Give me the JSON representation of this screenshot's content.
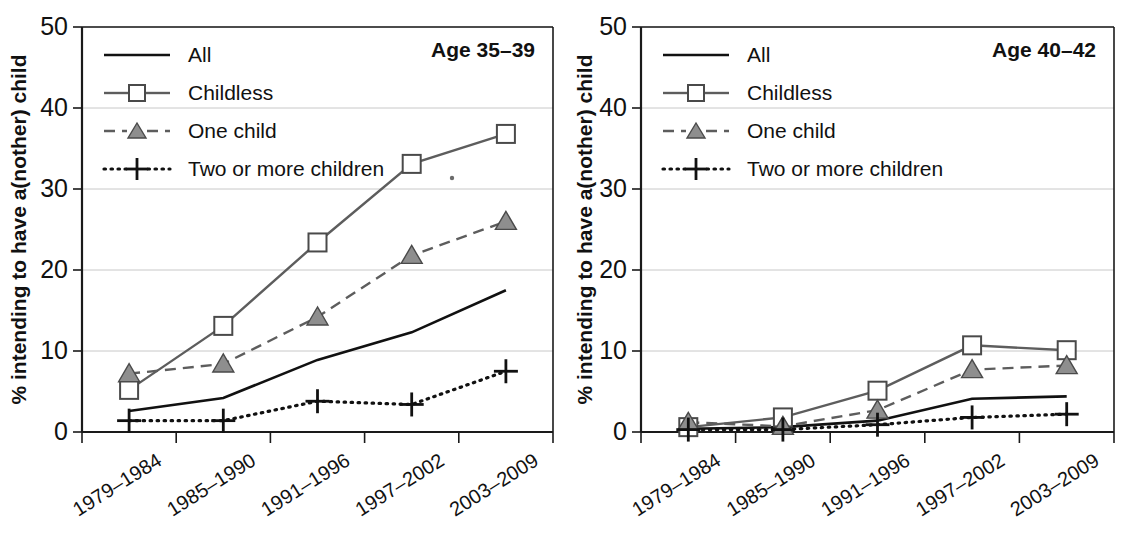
{
  "figure": {
    "background": "#ffffff",
    "accent_gray": "#8e8e8e",
    "line_dark": "#111111",
    "line_gray": "#5d5d5d",
    "grid_color": "#c8c8c8"
  },
  "panels": [
    {
      "id": "left",
      "title": "Age 35–39",
      "ylabel": "% intending to have a(nother) child"
    },
    {
      "id": "right",
      "title": "Age 40–42",
      "ylabel": "% intending to have a(nother) child"
    }
  ],
  "legend": {
    "entries": [
      {
        "label": "All",
        "style": "solid",
        "marker": "none"
      },
      {
        "label": "Childless",
        "style": "solid",
        "marker": "square"
      },
      {
        "label": "One child",
        "style": "dashed",
        "marker": "triangle"
      },
      {
        "label": "Two or more children",
        "style": "dotted",
        "marker": "plus"
      }
    ]
  },
  "axis": {
    "yticks": [
      "0",
      "10",
      "20",
      "30",
      "40",
      "50"
    ],
    "xticks": [
      "1979–1984",
      "1985–1990",
      "1991–1996",
      "1997–2002",
      "2003–2009"
    ]
  },
  "chart_data": [
    {
      "type": "line",
      "title": "Age 35–39",
      "xlabel": "",
      "ylabel": "% intending to have a(nother) child",
      "ylim": [
        0,
        50
      ],
      "yticks": [
        0,
        10,
        20,
        30,
        40,
        50
      ],
      "grid": true,
      "legend_position": "top-left",
      "categories": [
        "1979–1984",
        "1985–1990",
        "1991–1996",
        "1997–2002",
        "2003–2009"
      ],
      "series": [
        {
          "name": "All",
          "values": [
            2.6,
            4.2,
            8.9,
            12.3,
            17.5
          ]
        },
        {
          "name": "Childless",
          "values": [
            5.2,
            13.1,
            23.4,
            33.1,
            36.8
          ]
        },
        {
          "name": "One child",
          "values": [
            7.2,
            8.4,
            14.2,
            21.8,
            26.0
          ]
        },
        {
          "name": "Two or more children",
          "values": [
            1.4,
            1.4,
            3.8,
            3.4,
            7.5
          ]
        }
      ]
    },
    {
      "type": "line",
      "title": "Age 40–42",
      "xlabel": "",
      "ylabel": "% intending to have a(nother) child",
      "ylim": [
        0,
        50
      ],
      "yticks": [
        0,
        10,
        20,
        30,
        40,
        50
      ],
      "grid": true,
      "legend_position": "top-left",
      "categories": [
        "1979–1984",
        "1985–1990",
        "1991–1996",
        "1997–2002",
        "2003–2009"
      ],
      "series": [
        {
          "name": "All",
          "values": [
            0.4,
            0.6,
            1.4,
            4.1,
            4.4
          ]
        },
        {
          "name": "Childless",
          "values": [
            0.6,
            1.8,
            5.1,
            10.7,
            10.1
          ]
        },
        {
          "name": "One child",
          "values": [
            1.2,
            0.7,
            2.7,
            7.7,
            8.2
          ]
        },
        {
          "name": "Two or more children",
          "values": [
            0.3,
            0.3,
            0.9,
            1.8,
            2.2
          ]
        }
      ]
    }
  ]
}
